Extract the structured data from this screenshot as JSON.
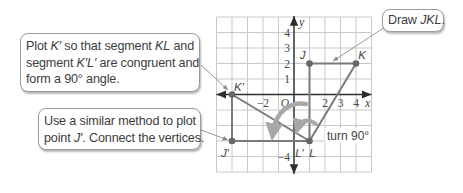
{
  "callouts": {
    "plot_k_prime": {
      "lines": [
        [
          {
            "t": "Plot ",
            "i": false
          },
          {
            "t": "K′",
            "i": true
          },
          {
            "t": " so that segment ",
            "i": false
          },
          {
            "t": "KL",
            "i": true
          },
          {
            "t": " and",
            "i": false
          }
        ],
        [
          {
            "t": "segment ",
            "i": false
          },
          {
            "t": "K′L′",
            "i": true
          },
          {
            "t": " are congruent and",
            "i": false
          }
        ],
        [
          {
            "t": "form a 90° angle.",
            "i": false
          }
        ]
      ]
    },
    "plot_j_prime": {
      "lines": [
        [
          {
            "t": "Use a similar method to plot",
            "i": false
          }
        ],
        [
          {
            "t": "point ",
            "i": false
          },
          {
            "t": "J′",
            "i": true
          },
          {
            "t": ". Connect the vertices.",
            "i": false
          }
        ]
      ]
    },
    "draw": {
      "lines": [
        [
          {
            "t": "Draw ",
            "i": false
          },
          {
            "t": "JKL",
            "i": true
          },
          {
            "t": ".",
            "i": false
          }
        ]
      ]
    }
  },
  "diagram": {
    "grid": {
      "xmin": -5,
      "xmax": 5,
      "ymin": -5,
      "ymax": 5
    },
    "axes": {
      "x_label": "x",
      "y_label": "y",
      "origin_label": "O"
    },
    "x_ticks": [
      {
        "value": -2,
        "label": "−2"
      },
      {
        "value": 2,
        "label": "2"
      },
      {
        "value": 3,
        "label": "3"
      },
      {
        "value": 4,
        "label": "4"
      }
    ],
    "y_ticks": [
      {
        "value": 4,
        "label": "4"
      },
      {
        "value": 3,
        "label": "3"
      },
      {
        "value": 2,
        "label": "2"
      },
      {
        "value": 1,
        "label": "1"
      },
      {
        "value": -4,
        "label": "−4"
      }
    ],
    "points": [
      {
        "name": "J",
        "x": 1,
        "y": 2,
        "label": "J",
        "dx": -7,
        "dy": -5
      },
      {
        "name": "K",
        "x": 4,
        "y": 2,
        "label": "K",
        "dx": 6,
        "dy": -5
      },
      {
        "name": "L",
        "x": 1,
        "y": -3,
        "label": "L",
        "dx": 3,
        "dy": 16
      },
      {
        "name": "K_prime",
        "x": -4,
        "y": 0,
        "label": "K′",
        "dx": 7,
        "dy": -4
      },
      {
        "name": "J_prime",
        "x": -4,
        "y": -3,
        "label": "J′",
        "dx": -7,
        "dy": 16
      },
      {
        "name": "L_prime",
        "x": 1,
        "y": -3,
        "label": "L′",
        "dx": -10,
        "dy": 16
      }
    ],
    "segments": [
      [
        "J",
        "K"
      ],
      [
        "K",
        "L"
      ],
      [
        "J",
        "L"
      ],
      [
        "K_prime",
        "J_prime"
      ],
      [
        "J_prime",
        "L_prime"
      ],
      [
        "K_prime",
        "L_prime"
      ]
    ],
    "rotation_label": "turn 90°",
    "colors": {
      "grid": "#c9c9c9",
      "axis": "#2e2e2e",
      "figure": "#7a7a7a",
      "point": "#666666",
      "turn_arrow": "#a8a8a8",
      "callout_border": "#9a9a9a"
    }
  }
}
